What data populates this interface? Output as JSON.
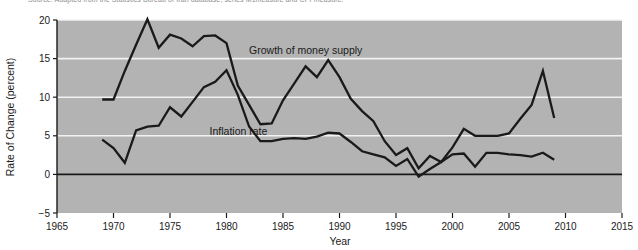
{
  "figure": {
    "source_note": "Source: Adapted from the Statistics Bureau of Iran database, series M1measure and CPI measure."
  },
  "chart_data": {
    "type": "line",
    "title": "",
    "xlabel": "Year",
    "ylabel": "Rate of Change (percent)",
    "xlim": [
      1965,
      2015
    ],
    "ylim": [
      -5,
      20
    ],
    "xticks": [
      1965,
      1970,
      1975,
      1980,
      1985,
      1990,
      1995,
      2000,
      2005,
      2010,
      2015
    ],
    "yticks": [
      -5,
      0,
      5,
      10,
      15,
      20
    ],
    "grid": "horizontal-white-gridlines-at-5-10-15-20-plus-black-zero-line",
    "plot_background": "#b3b3b3",
    "legend": "inline-annotations",
    "annotations": [
      {
        "text": "Growth of money supply",
        "x": 1982.0,
        "y": 15.6
      },
      {
        "text": "Inflation rate",
        "x": 1978.5,
        "y": 5.1
      }
    ],
    "series": [
      {
        "name": "Growth of money supply",
        "color": "#1a1a1a",
        "x": [
          1969,
          1970,
          1971,
          1972,
          1973,
          1974,
          1975,
          1976,
          1977,
          1978,
          1979,
          1980,
          1981,
          1982,
          1983,
          1984,
          1985,
          1986,
          1987,
          1988,
          1989,
          1990,
          1991,
          1992,
          1993,
          1994,
          1995,
          1996,
          1997,
          1998,
          1999,
          2000,
          2001,
          2002,
          2003,
          2004,
          2005,
          2006,
          2007,
          2008,
          2009
        ],
        "y": [
          9.7,
          9.7,
          13.4,
          16.8,
          20.1,
          16.4,
          18.1,
          17.6,
          16.6,
          17.9,
          18.0,
          17.0,
          11.5,
          9.0,
          6.5,
          6.6,
          9.6,
          11.8,
          14.0,
          12.6,
          14.8,
          12.6,
          9.8,
          8.2,
          6.9,
          4.3,
          2.5,
          3.4,
          0.8,
          2.4,
          1.6,
          3.5,
          5.9,
          5.0,
          5.0,
          5.0,
          5.3,
          7.2,
          9.0,
          13.4,
          7.3
        ]
      },
      {
        "name": "Inflation rate",
        "color": "#1a1a1a",
        "x": [
          1969,
          1970,
          1971,
          1972,
          1973,
          1974,
          1975,
          1976,
          1977,
          1978,
          1979,
          1980,
          1981,
          1982,
          1983,
          1984,
          1985,
          1986,
          1987,
          1988,
          1989,
          1990,
          1991,
          1992,
          1993,
          1994,
          1995,
          1996,
          1997,
          1998,
          1999,
          2000,
          2001,
          2002,
          2003,
          2004,
          2005,
          2006,
          2007,
          2008,
          2009
        ],
        "y": [
          4.5,
          3.4,
          1.5,
          5.7,
          6.2,
          6.3,
          8.7,
          7.5,
          9.4,
          11.3,
          12.0,
          13.5,
          10.3,
          6.2,
          4.3,
          4.3,
          4.6,
          4.7,
          4.6,
          4.9,
          5.4,
          5.3,
          4.2,
          3.0,
          2.6,
          2.2,
          1.1,
          2.0,
          -0.3,
          0.7,
          1.6,
          2.6,
          2.7,
          1.0,
          2.8,
          2.8,
          2.6,
          2.5,
          2.3,
          2.8,
          1.9
        ]
      }
    ]
  }
}
